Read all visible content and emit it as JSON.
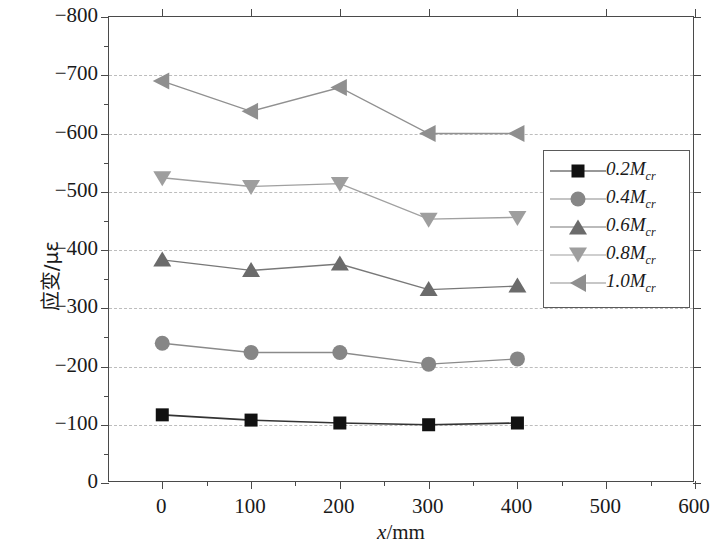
{
  "chart_data": {
    "type": "line",
    "title": "",
    "xlabel": "x/mm",
    "ylabel": "应变/με",
    "xlim": [
      -60,
      600
    ],
    "ylim": [
      -800,
      0
    ],
    "x_ticks": [
      0,
      100,
      200,
      300,
      400,
      500,
      600
    ],
    "y_ticks": [
      -800,
      -700,
      -600,
      -500,
      -400,
      -300,
      -200,
      -100,
      0
    ],
    "x_minor_step": 50,
    "y_minor_step": 50,
    "grid": "horizontal-dashed",
    "legend_position": "right-inside",
    "x": [
      0,
      100,
      200,
      300,
      400
    ],
    "series": [
      {
        "name": "0.2M",
        "sub": "cr",
        "label": "0.2Mcr",
        "marker": "square",
        "color": "#111111",
        "line_color": "#333333",
        "values": [
          -117,
          -108,
          -103,
          -100,
          -103
        ]
      },
      {
        "name": "0.4M",
        "sub": "cr",
        "label": "0.4Mcr",
        "marker": "circle",
        "color": "#868686",
        "line_color": "#8a8a8a",
        "values": [
          -240,
          -224,
          -224,
          -204,
          -213
        ]
      },
      {
        "name": "0.6M",
        "sub": "cr",
        "label": "0.6Mcr",
        "marker": "triangle-up",
        "color": "#6b6b6b",
        "line_color": "#787878",
        "values": [
          -383,
          -365,
          -376,
          -332,
          -338
        ]
      },
      {
        "name": "0.8M",
        "sub": "cr",
        "label": "0.8Mcr",
        "marker": "triangle-down",
        "color": "#9e9e9e",
        "line_color": "#a0a0a0",
        "values": [
          -524,
          -509,
          -514,
          -453,
          -456
        ]
      },
      {
        "name": "1.0M",
        "sub": "cr",
        "label": "1.0Mcr",
        "marker": "triangle-left",
        "color": "#8f8f8f",
        "line_color": "#909090",
        "values": [
          -690,
          -638,
          -679,
          -600,
          -600
        ]
      }
    ],
    "axis_color": "#4a4a4a",
    "grid_color": "#bdbdbd",
    "background": "#ffffff"
  },
  "legend": {
    "items": [
      {
        "label": "0.2M",
        "sub": "cr"
      },
      {
        "label": "0.4M",
        "sub": "cr"
      },
      {
        "label": "0.6M",
        "sub": "cr"
      },
      {
        "label": "0.8M",
        "sub": "cr"
      },
      {
        "label": "1.0M",
        "sub": "cr"
      }
    ]
  },
  "axes": {
    "x_title_var": "x",
    "x_title_unit": "/mm",
    "y_title": "应变/με"
  }
}
